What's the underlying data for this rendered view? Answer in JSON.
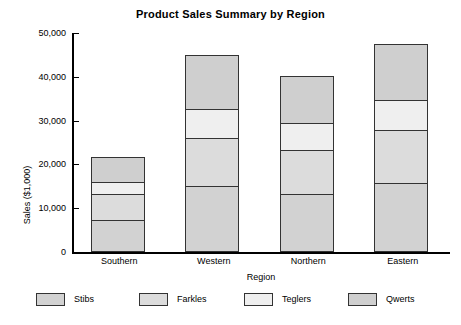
{
  "chart_data": {
    "type": "bar",
    "subtype": "stacked-bar",
    "title": "Product Sales Summary by Region",
    "xlabel": "Region",
    "ylabel": "Sales ($1,000)",
    "categories": [
      "Southern",
      "Western",
      "Northern",
      "Eastern"
    ],
    "ylim": [
      0,
      50000
    ],
    "yticks": [
      0,
      10000,
      20000,
      30000,
      40000,
      50000
    ],
    "ytick_labels": [
      "0",
      "10,000",
      "20,000",
      "30,000",
      "40,000",
      "50,000"
    ],
    "grid": false,
    "legend_position": "bottom",
    "series": [
      {
        "name": "Stibs",
        "color": "#d2d2d2",
        "values": [
          7070,
          14840,
          12950,
          15460
        ]
      },
      {
        "name": "Farkles",
        "color": "#dcdcdc",
        "values": [
          5870,
          10890,
          10110,
          12100
        ]
      },
      {
        "name": "Teglers",
        "color": "#efefef",
        "values": [
          2810,
          6780,
          6250,
          7000
        ]
      },
      {
        "name": "Qwerts",
        "color": "#cfcfcf",
        "values": [
          5710,
          12170,
          10640,
          12630
        ]
      }
    ],
    "totals": [
      21460,
      44680,
      39950,
      47190
    ]
  },
  "style": {
    "background": "#ffffff",
    "axis_color": "#000000",
    "bar_border": "#333333"
  }
}
